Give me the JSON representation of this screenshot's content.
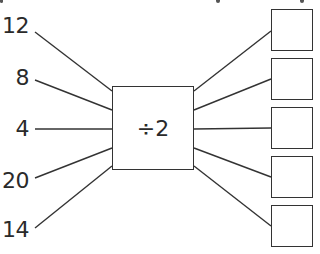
{
  "diagram": {
    "operation": "÷2",
    "inputs": [
      "12",
      "8",
      "4",
      "20",
      "14"
    ],
    "outputs": [
      "",
      "",
      "",
      "",
      ""
    ],
    "colors": {
      "line": "#333333",
      "text": "#2a2a2a",
      "background": "#ffffff"
    }
  }
}
